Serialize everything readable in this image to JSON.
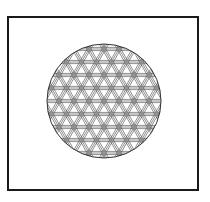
{
  "figure": {
    "frame": {
      "stroke": "#1a1a1a"
    },
    "circle": {
      "cx": 104,
      "cy": 101,
      "r": 57,
      "stroke": "#333333"
    },
    "pattern": {
      "name": "interlaced triangular lattice",
      "line_color": "#444444",
      "spacing": 13,
      "band_offsets": [
        -1.6,
        0,
        1.6
      ],
      "angles": [
        0,
        60,
        120
      ]
    }
  }
}
